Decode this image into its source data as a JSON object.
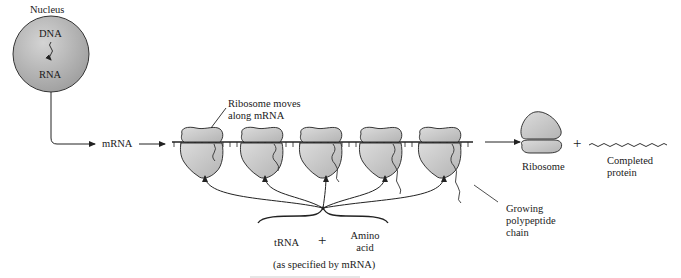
{
  "diagram": {
    "nucleus": {
      "label": "Nucleus",
      "dna_label": "DNA",
      "rna_label": "RNA",
      "fill_color": "#b8b8b8"
    },
    "mrna_label": "mRNA",
    "ribosome_moves_label_line1": "Ribosome moves",
    "ribosome_moves_label_line2": "along mRNA",
    "ribosome_count_on_mrna": 5,
    "released": {
      "ribosome_label": "Ribosome",
      "plus": "+",
      "protein_label_line1": "Completed",
      "protein_label_line2": "protein"
    },
    "growing_chain_label_line1": "Growing",
    "growing_chain_label_line2": "polypeptide",
    "growing_chain_label_line3": "chain",
    "inputs": {
      "trna_label": "tRNA",
      "plus": "+",
      "amino_acid_line1": "Amino",
      "amino_acid_line2": "acid",
      "note": "(as specified by mRNA)"
    },
    "colors": {
      "ribosome_fill": "#c9c9c9",
      "outline": "#222222",
      "background": "#ffffff"
    }
  }
}
